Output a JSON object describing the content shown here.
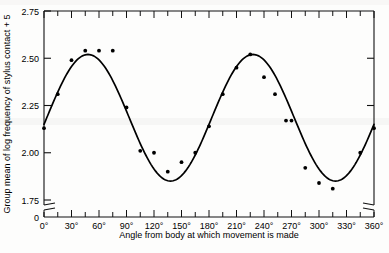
{
  "figure": {
    "background_color": "#fdfdfc",
    "ink_color": "#000000",
    "axis_break_present": true
  },
  "chart_data": {
    "type": "scatter",
    "title": "",
    "subtitle": "",
    "xlabel": "Angle from body at which movement is made",
    "ylabel": "Group mean of log frequency of stylus contact + 5",
    "xlim": [
      0,
      360
    ],
    "ylim": [
      1.75,
      2.75
    ],
    "y_axis_origin_label": "0",
    "grid": false,
    "legend": null,
    "xticks": [
      0,
      30,
      60,
      90,
      120,
      150,
      180,
      210,
      240,
      270,
      300,
      330,
      360
    ],
    "xticklabels": [
      "0°",
      "30°",
      "60°",
      "90°",
      "120°",
      "150°",
      "180°",
      "210°",
      "240°",
      "270°",
      "300°",
      "330°",
      "360°"
    ],
    "xminor_interval": 15,
    "yticks": [
      1.75,
      2.0,
      2.25,
      2.5,
      2.75
    ],
    "yticklabels": [
      "1.75",
      "2.00",
      "2.25",
      "2.50",
      "2.75"
    ],
    "series": [
      {
        "name": "Observed group means",
        "marker": "filled-circle",
        "color": "#000000",
        "x": [
          0,
          15,
          30,
          45,
          60,
          75,
          90,
          105,
          120,
          135,
          150,
          165,
          180,
          195,
          210,
          225,
          240,
          252,
          264,
          270,
          285,
          300,
          315,
          345,
          360
        ],
        "y": [
          2.13,
          2.31,
          2.49,
          2.54,
          2.54,
          2.54,
          2.24,
          2.01,
          2.0,
          1.9,
          1.95,
          2.0,
          2.14,
          2.31,
          2.45,
          2.52,
          2.4,
          2.31,
          2.17,
          2.17,
          1.92,
          1.84,
          1.81,
          2.0,
          2.13
        ]
      },
      {
        "name": "Fitted sinusoid (2 cycles)",
        "type": "line",
        "color": "#000000",
        "description": "Smooth double sine curve: peaks near 48° and 228° at about 2.52; troughs near 137° and 317° at about 1.85",
        "peaks": [
          {
            "x": 48,
            "y": 2.52
          },
          {
            "x": 228,
            "y": 2.52
          }
        ],
        "troughs": [
          {
            "x": 137,
            "y": 1.85
          },
          {
            "x": 317,
            "y": 1.85
          }
        ],
        "mean_level": 2.185,
        "amplitude": 0.335,
        "period": 180
      }
    ]
  }
}
